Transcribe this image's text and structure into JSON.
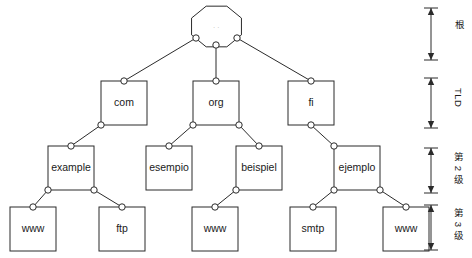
{
  "diagram": {
    "canvas": {
      "width": 472,
      "height": 258
    },
    "colors": {
      "stroke": "#2b2b2b",
      "fill": "#ffffff",
      "text": "#1a1a1a",
      "root_text": "#8d8d8d"
    },
    "root": {
      "shape": "octagon",
      "label": ". .",
      "cx": 216.5,
      "cy": 26.5,
      "rx": 27,
      "ry": 22
    },
    "tiers": [
      {
        "id": "root",
        "label": "根",
        "y_top": 8,
        "y_bottom": 60
      },
      {
        "id": "tld",
        "label": "TLD",
        "y_top": 78,
        "y_bottom": 128
      },
      {
        "id": "level2",
        "label": "第 2 级",
        "y_top": 148,
        "y_bottom": 193
      },
      {
        "id": "level3",
        "label": "第 3 级",
        "y_top": 205,
        "y_bottom": 250
      }
    ],
    "nodes": [
      {
        "id": "com",
        "label": "com",
        "x": 101,
        "y": 81,
        "w": 46,
        "h": 44,
        "tier": "tld"
      },
      {
        "id": "org",
        "label": "org",
        "x": 193,
        "y": 81,
        "w": 46,
        "h": 44,
        "tier": "tld"
      },
      {
        "id": "fi",
        "label": "fi",
        "x": 288,
        "y": 81,
        "w": 46,
        "h": 44,
        "tier": "tld"
      },
      {
        "id": "example",
        "label": "example",
        "x": 48,
        "y": 146,
        "w": 46,
        "h": 44,
        "tier": "level2"
      },
      {
        "id": "esempio",
        "label": "esempio",
        "x": 146,
        "y": 146,
        "w": 46,
        "h": 44,
        "tier": "level2"
      },
      {
        "id": "beispiel",
        "label": "beispiel",
        "x": 236,
        "y": 146,
        "w": 46,
        "h": 44,
        "tier": "level2"
      },
      {
        "id": "ejemplo",
        "label": "ejemplo",
        "x": 334,
        "y": 146,
        "w": 46,
        "h": 44,
        "tier": "level2"
      },
      {
        "id": "www1",
        "label": "www",
        "x": 10,
        "y": 207,
        "w": 46,
        "h": 44,
        "tier": "level3"
      },
      {
        "id": "ftp",
        "label": "ftp",
        "x": 99,
        "y": 207,
        "w": 46,
        "h": 44,
        "tier": "level3"
      },
      {
        "id": "www2",
        "label": "www",
        "x": 192,
        "y": 207,
        "w": 46,
        "h": 44,
        "tier": "level3"
      },
      {
        "id": "smtp",
        "label": "smtp",
        "x": 290,
        "y": 207,
        "w": 46,
        "h": 44,
        "tier": "level3"
      },
      {
        "id": "www3",
        "label": "www",
        "x": 383,
        "y": 207,
        "w": 46,
        "h": 44,
        "tier": "level3"
      }
    ],
    "edges": [
      {
        "from": "root",
        "to": "com",
        "from_x": 196,
        "from_y": 38,
        "to_x": 124,
        "to_y": 81
      },
      {
        "from": "root",
        "to": "org",
        "from_x": 216,
        "from_y": 45,
        "to_x": 216,
        "to_y": 81
      },
      {
        "from": "root",
        "to": "fi",
        "from_x": 237,
        "from_y": 38,
        "to_x": 311,
        "to_y": 81
      },
      {
        "from": "com",
        "to": "example",
        "from_x": 101,
        "from_y": 125,
        "to_x": 71,
        "to_y": 146
      },
      {
        "from": "org",
        "to": "esempio",
        "from_x": 193,
        "from_y": 125,
        "to_x": 169,
        "to_y": 146
      },
      {
        "from": "org",
        "to": "beispiel",
        "from_x": 239,
        "from_y": 125,
        "to_x": 259,
        "to_y": 146
      },
      {
        "from": "fi",
        "to": "ejemplo",
        "from_x": 311,
        "from_y": 125,
        "to_x": 334,
        "to_y": 146
      },
      {
        "from": "example",
        "to": "www1",
        "from_x": 48,
        "from_y": 190,
        "to_x": 33,
        "to_y": 207
      },
      {
        "from": "example",
        "to": "ftp",
        "from_x": 94,
        "from_y": 190,
        "to_x": 122,
        "to_y": 207
      },
      {
        "from": "beispiel",
        "to": "www2",
        "from_x": 236,
        "from_y": 190,
        "to_x": 215,
        "to_y": 207
      },
      {
        "from": "ejemplo",
        "to": "smtp",
        "from_x": 334,
        "from_y": 190,
        "to_x": 313,
        "to_y": 207
      },
      {
        "from": "ejemplo",
        "to": "www3",
        "from_x": 380,
        "from_y": 190,
        "to_x": 406,
        "to_y": 207
      }
    ]
  }
}
